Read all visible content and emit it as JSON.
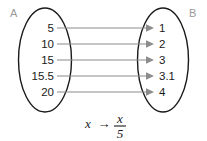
{
  "diagram": {
    "type": "mapping-diagram",
    "domain_set": {
      "name": "A",
      "label": "A",
      "elements": [
        {
          "value": "5"
        },
        {
          "value": "10"
        },
        {
          "value": "15"
        },
        {
          "value": "15.5"
        },
        {
          "value": "20"
        }
      ]
    },
    "codomain_set": {
      "name": "B",
      "label": "B",
      "elements": [
        {
          "value": "1"
        },
        {
          "value": "2"
        },
        {
          "value": "3"
        },
        {
          "value": "3.1"
        },
        {
          "value": "4"
        }
      ]
    },
    "mappings": [
      {
        "from": "5",
        "to": "1"
      },
      {
        "from": "10",
        "to": "2"
      },
      {
        "from": "15",
        "to": "3"
      },
      {
        "from": "15.5",
        "to": "3.1"
      },
      {
        "from": "20",
        "to": "4"
      }
    ],
    "rule": {
      "variable": "x",
      "operator": "→",
      "numerator": "x",
      "denominator": "5",
      "plain": "x → x/5"
    },
    "colors": {
      "oval_stroke": "#1a1a1a",
      "arrow": "#8c8c8c",
      "set_label": "#9a9a9a",
      "value_text": "#1a1a1a",
      "background": "#ffffff"
    }
  }
}
